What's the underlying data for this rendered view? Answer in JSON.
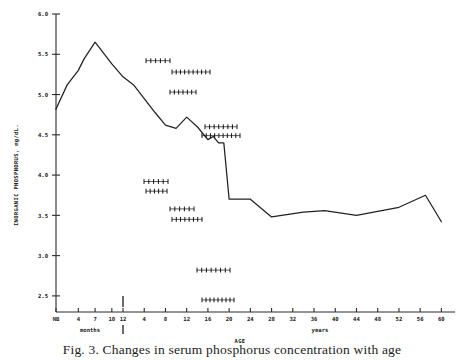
{
  "figure": {
    "caption": "Fig. 3. Changes in serum phosphorus concentration with age"
  },
  "chart_data": {
    "type": "line",
    "title": "",
    "xlabel": "AGE",
    "ylabel": "INORGANIC PHOSPHORUS, mg/dL.",
    "ylim": [
      2.3,
      6.0
    ],
    "yticks": [
      "2.5",
      "3.0",
      "3.5",
      "4.0",
      "4.5",
      "5.0",
      "5.5",
      "6.0"
    ],
    "ytick_values": [
      2.5,
      3.0,
      3.5,
      4.0,
      4.5,
      5.0,
      5.5,
      6.0
    ],
    "grid": false,
    "legend": false,
    "x_axis_segments": [
      {
        "unit": "months",
        "unit_label": "months",
        "ticks": [
          "NB",
          "4",
          "7",
          "10",
          "12"
        ],
        "tick_values": [
          0,
          4,
          7,
          10,
          12
        ]
      },
      {
        "unit": "years",
        "unit_label": "years",
        "ticks": [
          "4",
          "8",
          "12",
          "16",
          "20",
          "24",
          "28",
          "32",
          "36",
          "40",
          "44",
          "48",
          "52",
          "56",
          "60"
        ],
        "tick_values": [
          4,
          8,
          12,
          16,
          20,
          24,
          28,
          32,
          36,
          40,
          44,
          48,
          52,
          56,
          60
        ]
      }
    ],
    "series": [
      {
        "name": "Mean inorganic phosphorus",
        "points": [
          {
            "x_label": "NB",
            "segment": "months",
            "x": 0,
            "y": 4.82
          },
          {
            "x_label": "2 months",
            "segment": "months",
            "x": 2,
            "y": 5.12
          },
          {
            "x_label": "4 months",
            "segment": "months",
            "x": 4,
            "y": 5.3
          },
          {
            "x_label": "5 months",
            "segment": "months",
            "x": 5,
            "y": 5.44
          },
          {
            "x_label": "7 months",
            "segment": "months",
            "x": 7,
            "y": 5.65
          },
          {
            "x_label": "10 months",
            "segment": "months",
            "x": 10,
            "y": 5.38
          },
          {
            "x_label": "12 months",
            "segment": "months",
            "x": 12,
            "y": 5.22
          },
          {
            "x_label": "2 years",
            "segment": "years",
            "x": 2,
            "y": 5.12
          },
          {
            "x_label": "4 years",
            "segment": "years",
            "x": 4,
            "y": 4.95
          },
          {
            "x_label": "6 years",
            "segment": "years",
            "x": 6,
            "y": 4.78
          },
          {
            "x_label": "8 years",
            "segment": "years",
            "x": 8,
            "y": 4.62
          },
          {
            "x_label": "10 years",
            "segment": "years",
            "x": 10,
            "y": 4.58
          },
          {
            "x_label": "12 years",
            "segment": "years",
            "x": 12,
            "y": 4.72
          },
          {
            "x_label": "14 years",
            "segment": "years",
            "x": 14,
            "y": 4.6
          },
          {
            "x_label": "16 years",
            "segment": "years",
            "x": 16,
            "y": 4.44
          },
          {
            "x_label": "17 years",
            "segment": "years",
            "x": 17,
            "y": 4.48
          },
          {
            "x_label": "18 years",
            "segment": "years",
            "x": 18,
            "y": 4.4
          },
          {
            "x_label": "19 years",
            "segment": "years",
            "x": 19,
            "y": 4.4
          },
          {
            "x_label": "20 years",
            "segment": "years",
            "x": 20,
            "y": 3.7
          },
          {
            "x_label": "24 years",
            "segment": "years",
            "x": 24,
            "y": 3.7
          },
          {
            "x_label": "28 years",
            "segment": "years",
            "x": 28,
            "y": 3.48
          },
          {
            "x_label": "34 years",
            "segment": "years",
            "x": 34,
            "y": 3.54
          },
          {
            "x_label": "38 years",
            "segment": "years",
            "x": 38,
            "y": 3.56
          },
          {
            "x_label": "44 years",
            "segment": "years",
            "x": 44,
            "y": 3.5
          },
          {
            "x_label": "52 years",
            "segment": "years",
            "x": 52,
            "y": 3.6
          },
          {
            "x_label": "57 years",
            "segment": "years",
            "x": 57,
            "y": 3.75
          },
          {
            "x_label": "60 years",
            "segment": "years",
            "x": 60,
            "y": 3.42
          }
        ]
      }
    ],
    "marker_bands": [
      {
        "label": "band-1",
        "y": 5.42,
        "x_start_px": 146,
        "x_end_px": 170,
        "n_ticks": 6
      },
      {
        "label": "band-2",
        "y": 5.28,
        "x_start_px": 172,
        "x_end_px": 210,
        "n_ticks": 10
      },
      {
        "label": "band-3",
        "y": 5.03,
        "x_start_px": 170,
        "x_end_px": 196,
        "n_ticks": 7
      },
      {
        "label": "band-4",
        "y": 4.6,
        "x_start_px": 205,
        "x_end_px": 237,
        "n_ticks": 8
      },
      {
        "label": "band-5",
        "y": 4.49,
        "x_start_px": 202,
        "x_end_px": 240,
        "n_ticks": 10
      },
      {
        "label": "band-6",
        "y": 3.92,
        "x_start_px": 144,
        "x_end_px": 168,
        "n_ticks": 6
      },
      {
        "label": "band-7",
        "y": 3.8,
        "x_start_px": 146,
        "x_end_px": 167,
        "n_ticks": 6
      },
      {
        "label": "band-8",
        "y": 3.58,
        "x_start_px": 170,
        "x_end_px": 194,
        "n_ticks": 6
      },
      {
        "label": "band-9",
        "y": 3.45,
        "x_start_px": 172,
        "x_end_px": 202,
        "n_ticks": 8
      },
      {
        "label": "band-10",
        "y": 2.82,
        "x_start_px": 197,
        "x_end_px": 230,
        "n_ticks": 8
      },
      {
        "label": "band-11",
        "y": 2.45,
        "x_start_px": 202,
        "x_end_px": 234,
        "n_ticks": 9
      }
    ]
  }
}
